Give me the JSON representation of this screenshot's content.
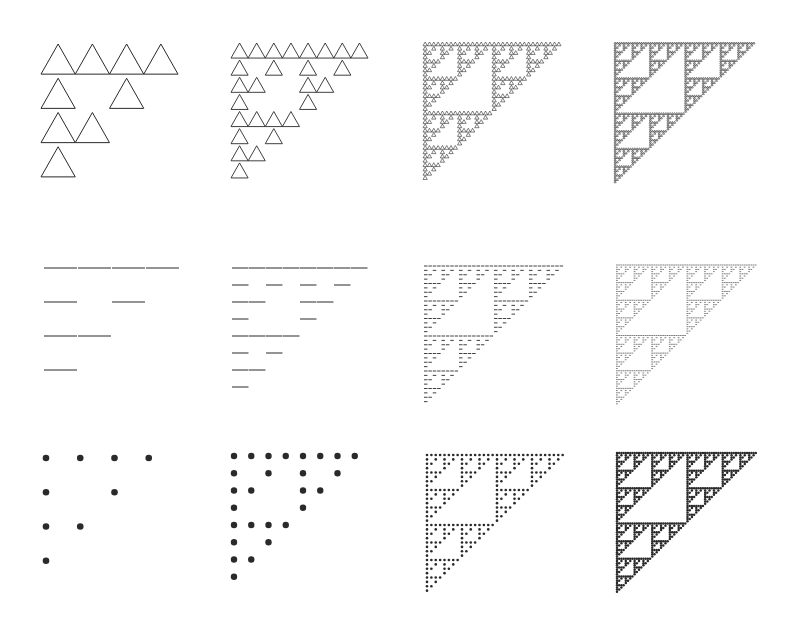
{
  "figure": {
    "ink_color": "#2a2a2a",
    "levels_per_column": [
      4,
      8,
      32,
      64
    ],
    "rows": [
      {
        "style": "triangle",
        "label": "triangle-glyph rendering"
      },
      {
        "style": "segment",
        "label": "line-segment rendering"
      },
      {
        "style": "dot",
        "label": "dot rendering"
      }
    ],
    "panels": [
      {
        "row": 0,
        "col": 0,
        "style": "triangle",
        "n": 4,
        "x": 41,
        "y": 44,
        "size": 137,
        "stroke": 1.0
      },
      {
        "row": 0,
        "col": 1,
        "style": "triangle",
        "n": 8,
        "x": 231,
        "y": 43,
        "size": 137,
        "stroke": 0.9
      },
      {
        "row": 0,
        "col": 2,
        "style": "triangle",
        "n": 32,
        "x": 423,
        "y": 42,
        "size": 138,
        "stroke": 0.6
      },
      {
        "row": 0,
        "col": 3,
        "style": "triangle",
        "n": 64,
        "x": 614,
        "y": 42,
        "size": 141,
        "stroke": 0.55
      },
      {
        "row": 1,
        "col": 0,
        "style": "segment",
        "n": 4,
        "x": 44,
        "y": 268,
        "size": 136,
        "stroke": 1.2
      },
      {
        "row": 1,
        "col": 1,
        "style": "segment",
        "n": 8,
        "x": 232,
        "y": 268,
        "size": 136,
        "stroke": 1.1
      },
      {
        "row": 1,
        "col": 2,
        "style": "segment",
        "n": 32,
        "x": 424,
        "y": 266,
        "size": 140,
        "stroke": 0.9
      },
      {
        "row": 1,
        "col": 3,
        "style": "segment",
        "n": 64,
        "x": 616,
        "y": 265,
        "size": 141,
        "stroke": 0.6
      },
      {
        "row": 2,
        "col": 0,
        "style": "dot",
        "n": 4,
        "x": 46,
        "y": 458,
        "size": 137,
        "stroke": 3.3
      },
      {
        "row": 2,
        "col": 1,
        "style": "dot",
        "n": 8,
        "x": 234,
        "y": 456,
        "size": 138,
        "stroke": 3.2
      },
      {
        "row": 2,
        "col": 2,
        "style": "dot",
        "n": 32,
        "x": 427,
        "y": 455,
        "size": 140,
        "stroke": 1.3
      },
      {
        "row": 2,
        "col": 3,
        "style": "dot",
        "n": 64,
        "x": 617,
        "y": 453,
        "size": 141,
        "stroke": 1.25
      }
    ]
  }
}
